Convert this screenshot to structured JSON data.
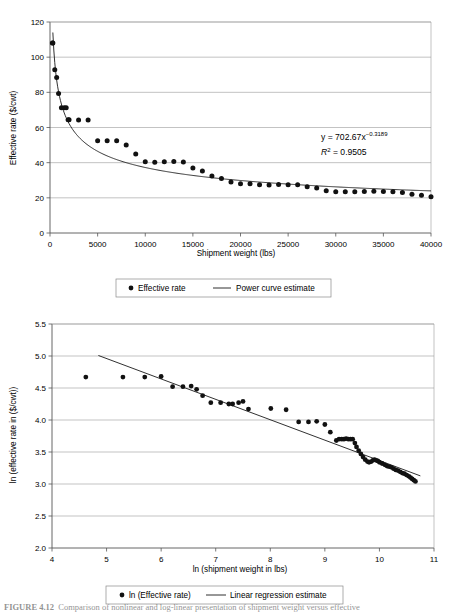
{
  "chart_data": [
    {
      "id": "top",
      "type": "scatter",
      "title": "",
      "xlabel": "Shipment weight (lbs)",
      "ylabel": "Effective rate ($/cwt)",
      "xlim": [
        0,
        40000
      ],
      "ylim": [
        0,
        120
      ],
      "xticks": [
        0,
        5000,
        10000,
        15000,
        20000,
        25000,
        30000,
        35000,
        40000
      ],
      "yticks": [
        0,
        20,
        40,
        60,
        80,
        100,
        120
      ],
      "grid": "horizontal",
      "legend_position": "below",
      "annotation_equation": "y = 702.67x",
      "annotation_exponent": "−0.3189",
      "annotation_r2_label": "R",
      "annotation_r2_sup": "2",
      "annotation_r2_value": "= 0.9505",
      "series": [
        {
          "name": "Effective rate",
          "marker": "circle",
          "x": [
            250,
            300,
            500,
            700,
            900,
            1200,
            1500,
            1700,
            1900,
            2000,
            3000,
            4000,
            5000,
            6000,
            7000,
            8000,
            9000,
            10000,
            11000,
            12000,
            13000,
            14000,
            15000,
            16000,
            17000,
            18000,
            19000,
            20000,
            21000,
            22000,
            23000,
            24000,
            25000,
            26000,
            27000,
            28000,
            29000,
            30000,
            31000,
            32000,
            33000,
            34000,
            35000,
            36000,
            37000,
            38000,
            39000,
            40000
          ],
          "y": [
            108.0,
            108.0,
            92.8,
            88.5,
            79.4,
            71.2,
            71.2,
            71.3,
            64.4,
            64.4,
            64.3,
            64.2,
            52.5,
            52.4,
            52.5,
            50.0,
            45.0,
            40.5,
            40.3,
            40.5,
            40.7,
            40.4,
            37.0,
            35.2,
            32.4,
            31.0,
            29.0,
            28.0,
            28.0,
            27.5,
            27.3,
            27.6,
            27.5,
            27.4,
            26.3,
            25.6,
            24.0,
            23.4,
            23.4,
            23.5,
            23.6,
            23.7,
            23.6,
            23.4,
            23.0,
            22.0,
            21.5,
            20.6
          ]
        },
        {
          "name": "Power curve estimate",
          "marker": "line",
          "formula": "y = 702.67 * x^(-0.3189)"
        }
      ],
      "legend": [
        {
          "label": "Effective rate",
          "marker": "dot"
        },
        {
          "label": "Power curve estimate",
          "marker": "line"
        }
      ]
    },
    {
      "id": "bottom",
      "type": "scatter",
      "title": "",
      "xlabel": "ln (shipment weight in lbs)",
      "ylabel": "ln (effective rate in ($/cwt))",
      "xlim": [
        4,
        11
      ],
      "ylim": [
        2.0,
        5.5
      ],
      "xticks": [
        4,
        5,
        6,
        7,
        8,
        9,
        10,
        11
      ],
      "yticks": [
        "2.0",
        "2.5",
        "3.0",
        "3.5",
        "4.0",
        "4.5",
        "5.0",
        "5.5"
      ],
      "grid": "horizontal",
      "legend_position": "below",
      "annotation_equation": "y = −0.3189x + 6.5549",
      "annotation_r2_label": "R",
      "annotation_r2_sup": "2",
      "annotation_r2_value": "= 0.9505",
      "series": [
        {
          "name": "ln (Effective rate)",
          "marker": "circle",
          "x": [
            4.62,
            5.3,
            5.7,
            6.0,
            6.21,
            6.4,
            6.55,
            6.65,
            6.76,
            6.91,
            7.09,
            7.24,
            7.31,
            7.42,
            7.5,
            7.6,
            8.01,
            8.29,
            8.52,
            8.7,
            8.85,
            9.0,
            9.1,
            9.21,
            9.26,
            9.31,
            9.35,
            9.39,
            9.43,
            9.47,
            9.51,
            9.55,
            9.58,
            9.62,
            9.66,
            9.7,
            9.74,
            9.78,
            9.81,
            9.85,
            9.88,
            9.91,
            9.94,
            9.97,
            10.0,
            10.05,
            10.1,
            10.14,
            10.18,
            10.22,
            10.26,
            10.3,
            10.34,
            10.38,
            10.42,
            10.46,
            10.5,
            10.54,
            10.57,
            10.6,
            10.63,
            10.66
          ],
          "y": [
            4.67,
            4.67,
            4.67,
            4.68,
            4.52,
            4.52,
            4.53,
            4.48,
            4.38,
            4.27,
            4.27,
            4.25,
            4.25,
            4.27,
            4.29,
            4.17,
            4.18,
            4.16,
            3.97,
            3.97,
            3.98,
            3.93,
            3.81,
            3.68,
            3.7,
            3.7,
            3.7,
            3.71,
            3.7,
            3.7,
            3.7,
            3.64,
            3.58,
            3.52,
            3.47,
            3.42,
            3.38,
            3.35,
            3.34,
            3.35,
            3.37,
            3.38,
            3.37,
            3.36,
            3.34,
            3.32,
            3.3,
            3.28,
            3.27,
            3.26,
            3.24,
            3.22,
            3.21,
            3.19,
            3.17,
            3.16,
            3.14,
            3.12,
            3.1,
            3.08,
            3.06,
            3.04
          ]
        },
        {
          "name": "Linear regression estimate",
          "marker": "line",
          "formula": "y = -0.3189x + 6.5549"
        }
      ],
      "legend": [
        {
          "label": "ln (Effective rate)",
          "marker": "dot"
        },
        {
          "label": "Linear regression estimate",
          "marker": "line"
        }
      ]
    }
  ],
  "colors": {
    "point": "#111111",
    "curve": "#1a1a1a",
    "grid": "#9a9a9a",
    "axis": "#555555",
    "background": "#ffffff"
  },
  "caption": {
    "figure_label": "FIGURE 4.12",
    "text": "Comparison of nonlinear and log-linear presentation of shipment weight versus effective"
  }
}
